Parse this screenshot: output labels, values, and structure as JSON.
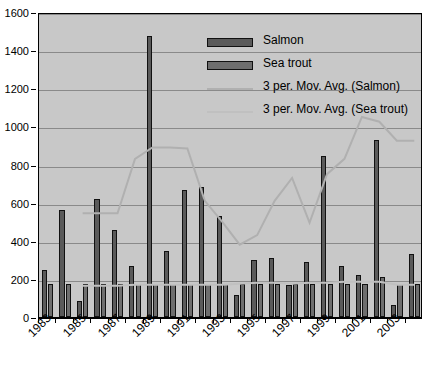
{
  "chart_data": {
    "type": "bar",
    "title": "",
    "xlabel": "",
    "ylabel": "",
    "ylim": [
      0,
      1600
    ],
    "ytick_step": 200,
    "yticks": [
      0,
      200,
      400,
      600,
      800,
      1000,
      1200,
      1400,
      1600
    ],
    "grid": true,
    "legend_position": "inside-top-center",
    "categories": [
      1983,
      1984,
      1985,
      1986,
      1987,
      1988,
      1989,
      1990,
      1991,
      1992,
      1993,
      1994,
      1995,
      1996,
      1997,
      1998,
      1999,
      2000,
      2001,
      2002,
      2003,
      2004
    ],
    "xtick_labels": [
      "1983",
      "1985",
      "1987",
      "1989",
      "1991",
      "1993",
      "1995",
      "1997",
      "1999",
      "2001",
      "2003"
    ],
    "series": [
      {
        "name": "Salmon",
        "type": "bar",
        "color": "#5a5a5a",
        "values": [
          245,
          560,
          85,
          620,
          455,
          265,
          1475,
          345,
          665,
          680,
          530,
          115,
          300,
          310,
          170,
          290,
          845,
          270,
          220,
          930,
          65,
          330
        ]
      },
      {
        "name": "Sea trout",
        "type": "bar",
        "color": "#6e6e6e",
        "values": [
          175,
          175,
          175,
          175,
          175,
          175,
          175,
          175,
          175,
          175,
          175,
          175,
          175,
          175,
          175,
          175,
          175,
          175,
          175,
          210,
          175,
          175
        ]
      },
      {
        "name": "3 per. Mov. Avg. (Salmon)",
        "type": "line",
        "color": "#b0b0b0",
        "values": [
          null,
          null,
          555,
          555,
          555,
          840,
          900,
          900,
          895,
          620,
          510,
          390,
          440,
          620,
          740,
          690,
          555,
          620,
          615,
          390,
          505,
          680
        ]
      },
      {
        "name": "3 per. Mov. Avg. (Sea trout)",
        "type": "line",
        "color": "#c0c0c0",
        "values": [
          null,
          null,
          175,
          175,
          175,
          180,
          180,
          180,
          180,
          180,
          180,
          185,
          190,
          190,
          185,
          190,
          190,
          195,
          195,
          195,
          180,
          180
        ]
      }
    ],
    "salmon_moving_avg_tail": [
      505,
      760,
      840,
      1060,
      1035,
      935,
      935
    ]
  },
  "legend": {
    "items": [
      {
        "label": "Salmon",
        "marker": "bar",
        "color": "#5a5a5a"
      },
      {
        "label": "Sea trout",
        "marker": "bar",
        "color": "#6e6e6e"
      },
      {
        "label": "3 per. Mov. Avg. (Salmon)",
        "marker": "line",
        "color": "#b0b0b0"
      },
      {
        "label": "3 per. Mov. Avg. (Sea trout)",
        "marker": "line",
        "color": "#c0c0c0"
      }
    ]
  },
  "axis": {
    "y_labels": [
      "1600",
      "1400",
      "1200",
      "1000",
      "800",
      "600",
      "400",
      "200",
      "0"
    ],
    "x_labels": [
      "1983",
      "1985",
      "1987",
      "1989",
      "1991",
      "1993",
      "1995",
      "1997",
      "1999",
      "2001",
      "2003"
    ]
  },
  "colors": {
    "plot_background": "#c8c8c8",
    "gridline": "#8a8a8a",
    "axis": "#000000",
    "salmon_bar": "#5a5a5a",
    "seatrout_bar": "#6e6e6e",
    "salmon_avg_line": "#b0b0b0",
    "seatrout_avg_line": "#c0c0c0"
  }
}
